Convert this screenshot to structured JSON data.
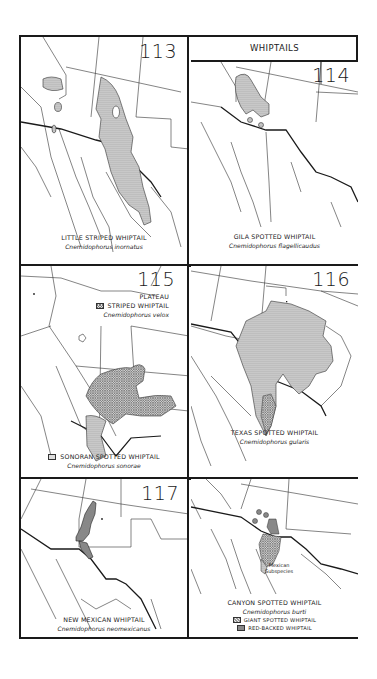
{
  "header": {
    "title": "WHIPTAILS"
  },
  "panels": [
    {
      "number": "113",
      "common_name": "LITTLE STRIPED WHIPTAIL",
      "scientific_name": "Cnemidophorus inornatus"
    },
    {
      "number": "114",
      "common_name": "GILA SPOTTED WHIPTAIL",
      "scientific_name": "Cnemidophorus flagellicaudus"
    },
    {
      "number": "115",
      "species": [
        {
          "common_name_line1": "PLATEAU",
          "common_name_line2": "STRIPED WHIPTAIL",
          "scientific_name": "Cnemidophorus velox",
          "pattern": "crosshatch"
        },
        {
          "common_name": "SONORAN SPOTTED WHIPTAIL",
          "scientific_name": "Cnemidophorus sonorae",
          "pattern": "stipple"
        }
      ]
    },
    {
      "number": "116",
      "common_name": "TEXAS SPOTTED WHIPTAIL",
      "scientific_name": "Cnemidophorus gularis"
    },
    {
      "number": "117",
      "common_name": "NEW MEXICAN WHIPTAIL",
      "scientific_name": "Cnemidophorus neomexicanus"
    },
    {
      "number": "118",
      "common_name": "CANYON SPOTTED WHIPTAIL",
      "scientific_name": "Cnemidophorus burti",
      "annotation": [
        "Mexican",
        "Subspecies"
      ],
      "legend": [
        {
          "label": "GIANT SPOTTED WHIPTAIL",
          "pattern": "giant"
        },
        {
          "label": "RED-BACKED WHIPTAIL",
          "pattern": "red"
        }
      ]
    }
  ],
  "colors": {
    "ink": "#1a1a1a",
    "range_fill": "#c8c8c8",
    "background": "#ffffff"
  }
}
